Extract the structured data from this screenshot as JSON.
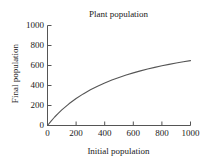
{
  "chart_data": {
    "type": "line",
    "title": "Plant population",
    "xlabel": "Initial population",
    "ylabel": "Final population",
    "xlim": [
      0,
      1000
    ],
    "ylim": [
      0,
      1000
    ],
    "xticks": [
      0,
      200,
      400,
      600,
      800,
      1000
    ],
    "yticks": [
      0,
      200,
      400,
      600,
      800,
      1000
    ],
    "xtick_labels": [
      "0",
      "200",
      "400",
      "600",
      "800",
      "1000"
    ],
    "ytick_labels": [
      "0",
      "200",
      "400",
      "600",
      "800",
      "1000"
    ],
    "grid": false,
    "legend": null,
    "series": [
      {
        "name": "final population",
        "color": "#555555",
        "x": [
          0,
          25,
          50,
          75,
          100,
          150,
          200,
          250,
          300,
          350,
          400,
          450,
          500,
          550,
          600,
          650,
          700,
          750,
          800,
          850,
          900,
          950,
          1000
        ],
        "y": [
          0,
          44,
          85,
          122,
          156,
          217,
          270,
          316,
          357,
          393,
          426,
          455,
          481,
          505,
          526,
          546,
          565,
          581,
          597,
          611,
          625,
          637,
          649
        ]
      }
    ]
  },
  "axes": {
    "spines": {
      "left": true,
      "bottom": true,
      "top": false,
      "right": false
    },
    "tick_direction": "in",
    "axis_color": "#555555"
  }
}
